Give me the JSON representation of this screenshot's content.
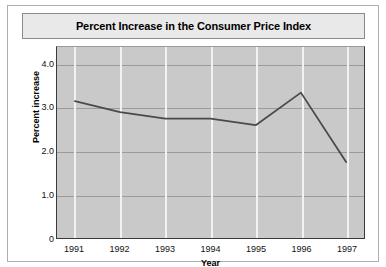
{
  "chart_data": {
    "type": "line",
    "title": "Percent Increase in the Consumer Price Index",
    "xlabel": "Year",
    "ylabel": "Percent increase",
    "categories": [
      "1991",
      "1992",
      "1993",
      "1994",
      "1995",
      "1996",
      "1997"
    ],
    "values": [
      3.15,
      2.9,
      2.75,
      2.75,
      2.6,
      3.35,
      1.75
    ],
    "ylim": [
      0,
      4.4
    ],
    "yticks": [
      "0",
      "1.0",
      "2.0",
      "3.0",
      "4.0"
    ],
    "ytick_values": [
      0,
      1.0,
      2.0,
      3.0,
      4.0
    ],
    "grid": "horizontal-gray-and-vertical-white",
    "legend": "none",
    "series": [
      {
        "name": "Percent increase",
        "values": [
          3.15,
          2.9,
          2.75,
          2.75,
          2.6,
          3.35,
          1.75
        ]
      }
    ],
    "colors": {
      "line": "#4a4a4a",
      "plot_background": "#c9c9c9",
      "title_background": "#e9e9e9",
      "horizontal_gridline": "#9b9b9b",
      "vertical_gridline": "#f2f2f2",
      "axis": "#3a3a3a",
      "figure_background": "#ffffff"
    }
  }
}
